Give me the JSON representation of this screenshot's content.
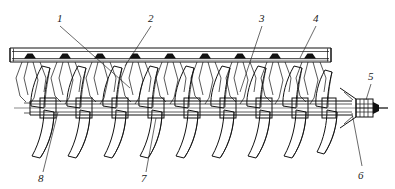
{
  "figure": {
    "type": "technical-line-drawing",
    "background_color": "#ffffff",
    "ink_color": "#111111",
    "width": 395,
    "height": 189
  },
  "callouts": [
    {
      "id": "1",
      "label": "1",
      "text_x": 57,
      "text_y": 22,
      "leader": "M60,26 L130,88",
      "points_to": "auger-flight-left"
    },
    {
      "id": "2",
      "label": "2",
      "text_x": 148,
      "text_y": 22,
      "leader": "M151,26 L125,66",
      "points_to": "rail-tooth-mid-left"
    },
    {
      "id": "3",
      "label": "3",
      "text_x": 259,
      "text_y": 22,
      "leader": "M262,26 L240,92",
      "points_to": "auger-flight-right"
    },
    {
      "id": "4",
      "label": "4",
      "text_x": 313,
      "text_y": 22,
      "leader": "M316,26 L300,58",
      "points_to": "toothed-rail"
    },
    {
      "id": "5",
      "label": "5",
      "text_x": 368,
      "text_y": 80,
      "leader": "M371,84 L366,100",
      "points_to": "splined-shaft-end"
    },
    {
      "id": "6",
      "label": "6",
      "text_x": 361,
      "text_y": 175,
      "leader": "M362,166 L352,113",
      "points_to": "tapered-hub"
    },
    {
      "id": "7",
      "label": "7",
      "text_x": 143,
      "text_y": 180,
      "leader": "M146,172 L156,118",
      "points_to": "shaft"
    },
    {
      "id": "8",
      "label": "8",
      "text_x": 40,
      "text_y": 180,
      "leader": "M43,172 L58,112",
      "points_to": "hub-collar"
    }
  ],
  "components": {
    "toothed_rail": {
      "name": "toothed-rail",
      "x_start": 10,
      "x_end": 331,
      "y_top": 48,
      "y_bottom": 62,
      "tooth_count": 9
    },
    "shaft": {
      "name": "central-shaft",
      "center_y": 108,
      "x_start": 14,
      "x_end": 388
    },
    "flights": {
      "name": "helical-flights",
      "count": 9,
      "pitch": 36,
      "first_center_x": 46
    },
    "end_fitting": {
      "name": "splined-shaft-end",
      "x": 352,
      "y": 108
    }
  }
}
